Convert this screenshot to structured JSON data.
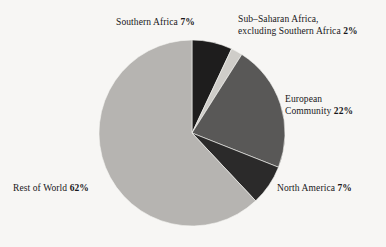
{
  "figure": {
    "background_color": "#f7f6f4",
    "text_color": "#17161a"
  },
  "chart_data": {
    "type": "pie",
    "title": "",
    "subtitle": "",
    "xlabel": "",
    "ylabel": "",
    "legend_position": "none",
    "grid": false,
    "units": "percent",
    "total": 100,
    "start_angle_deg": 0,
    "direction": "clockwise",
    "center": {
      "x": 192,
      "y": 133
    },
    "radius": 93,
    "categories": [
      "Southern Africa",
      "Sub-Saharan Africa, excluding Southern Africa",
      "European Community",
      "North America",
      "Rest of World"
    ],
    "values": [
      7,
      2,
      22,
      7,
      62
    ],
    "slices": [
      {
        "name": "Southern Africa",
        "value": 7,
        "value_text": "7%",
        "color": "#1e1d1d",
        "start_deg": 0,
        "end_deg": 25.2
      },
      {
        "name": "Sub-Saharan Africa, excluding Southern Africa",
        "value": 2,
        "value_text": "2%",
        "color": "#cfcdc9",
        "start_deg": 25.2,
        "end_deg": 32.4
      },
      {
        "name": "European Community",
        "value": 22,
        "value_text": "22%",
        "color": "#595857",
        "start_deg": 32.4,
        "end_deg": 111.6
      },
      {
        "name": "North America",
        "value": 7,
        "value_text": "7%",
        "color": "#2b2a2a",
        "start_deg": 111.6,
        "end_deg": 136.8
      },
      {
        "name": "Rest of World",
        "value": 62,
        "value_text": "62%",
        "color": "#b6b4b1",
        "start_deg": 136.8,
        "end_deg": 360
      }
    ]
  },
  "labels": {
    "southern_africa": {
      "line1_text": "Southern Africa ",
      "line1_value": "7%"
    },
    "sub_saharan": {
      "line1_text": "Sub–Saharan Africa,",
      "line2_text": "excluding Southern Africa ",
      "line2_value": "2%"
    },
    "european_community": {
      "line1_text": "European",
      "line2_text": "Community ",
      "line2_value": "22%"
    },
    "north_america": {
      "line1_text": "North America ",
      "line1_value": "7%"
    },
    "rest_of_world": {
      "line1_text": "Rest of World ",
      "line1_value": "62%"
    }
  }
}
